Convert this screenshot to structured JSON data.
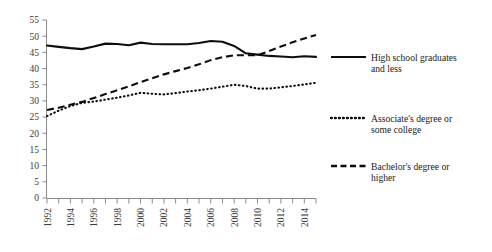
{
  "chart_data": {
    "type": "line",
    "title": "",
    "xlabel": "",
    "ylabel": "",
    "ylim": [
      0,
      55
    ],
    "ytick_labels": [
      "0",
      "5",
      "10",
      "15",
      "20",
      "25",
      "30",
      "35",
      "40",
      "45",
      "50",
      "55"
    ],
    "ytick_values": [
      0,
      5,
      10,
      15,
      20,
      25,
      30,
      35,
      40,
      45,
      50,
      55
    ],
    "grid": false,
    "legend_position": "right",
    "x": [
      1992,
      1993,
      1994,
      1995,
      1996,
      1997,
      1998,
      1999,
      2000,
      2001,
      2002,
      2003,
      2004,
      2005,
      2006,
      2007,
      2008,
      2009,
      2010,
      2011,
      2012,
      2013,
      2014,
      2015
    ],
    "xtick_labels": [
      "1992",
      "1994",
      "1996",
      "1998",
      "2000",
      "2002",
      "2004",
      "2006",
      "2008",
      "2010",
      "2012",
      "2014"
    ],
    "xtick_values": [
      1992,
      1994,
      1996,
      1998,
      2000,
      2002,
      2004,
      2006,
      2008,
      2010,
      2012,
      2014
    ],
    "series": [
      {
        "name": "High school graduates and less",
        "style": "solid",
        "color": "#0d0d0d",
        "values": [
          47.1,
          46.7,
          46.3,
          46.0,
          46.8,
          47.7,
          47.6,
          47.2,
          48.0,
          47.6,
          47.5,
          47.5,
          47.5,
          47.9,
          48.5,
          48.3,
          47.0,
          44.7,
          44.3,
          43.9,
          43.7,
          43.5,
          43.8,
          43.6
        ]
      },
      {
        "name": "Associate's degree or some college",
        "style": "dotted",
        "color": "#0d0d0d",
        "values": [
          25.3,
          27.0,
          28.4,
          29.4,
          29.8,
          30.4,
          31.0,
          31.7,
          32.5,
          32.2,
          32.0,
          32.4,
          32.9,
          33.3,
          33.8,
          34.4,
          35.0,
          34.6,
          33.8,
          33.8,
          34.2,
          34.6,
          35.1,
          35.6
        ]
      },
      {
        "name": "Bachelor's degree or higher",
        "style": "dashed",
        "color": "#0d0d0d",
        "values": [
          27.2,
          27.9,
          28.8,
          29.7,
          30.9,
          32.1,
          33.3,
          34.5,
          35.8,
          37.0,
          38.2,
          39.2,
          40.2,
          41.3,
          42.6,
          43.5,
          44.1,
          44.1,
          44.1,
          45.4,
          46.8,
          48.1,
          49.3,
          50.4
        ]
      }
    ]
  },
  "legend": {
    "entries": [
      {
        "label_line1": "High school graduates",
        "label_line2": "and less",
        "style": "solid"
      },
      {
        "label_line1": "Associate's degree or",
        "label_line2": "some college",
        "style": "dotted"
      },
      {
        "label_line1": "Bachelor's degree or",
        "label_line2": "higher",
        "style": "dashed"
      }
    ]
  },
  "colors": {
    "line": "#0d0d0d",
    "axis": "#8a8a8a",
    "tick_text": "#3a3a3a",
    "background": "#ffffff"
  }
}
